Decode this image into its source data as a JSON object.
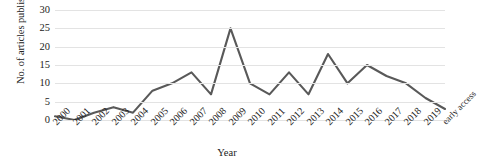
{
  "chart_data": {
    "type": "line",
    "title": "",
    "xlabel": "Year",
    "ylabel": "No. of articles published",
    "categories": [
      "2000",
      "2001",
      "2002",
      "2003",
      "2004",
      "2005",
      "2006",
      "2007",
      "2008",
      "2009",
      "2010",
      "2011",
      "2012",
      "2013",
      "2014",
      "2015",
      "2016",
      "2017",
      "2018",
      "2019",
      "early access"
    ],
    "values": [
      1,
      0,
      2,
      3.5,
      2,
      8,
      10,
      13,
      7,
      25,
      10,
      7,
      13,
      7,
      18,
      10,
      15,
      12,
      10,
      6,
      3
    ],
    "series": [
      {
        "name": "No. of articles published",
        "values": [
          1,
          0,
          2,
          3.5,
          2,
          8,
          10,
          13,
          7,
          25,
          10,
          7,
          13,
          7,
          18,
          10,
          15,
          12,
          10,
          6,
          3
        ]
      }
    ],
    "ylim": [
      0,
      30
    ],
    "yticks": [
      0,
      5,
      10,
      15,
      20,
      25,
      30
    ],
    "ytick_labels": [
      "0",
      "5",
      "10",
      "15",
      "20",
      "25",
      "30"
    ],
    "grid": true,
    "grid_axis": "y",
    "legend": "none",
    "line_color": "#595959",
    "grid_color": "#e3e3e3",
    "background_color": "#ffffff"
  },
  "axes": {
    "y_title": "No. of articles published",
    "x_title": "Year"
  }
}
